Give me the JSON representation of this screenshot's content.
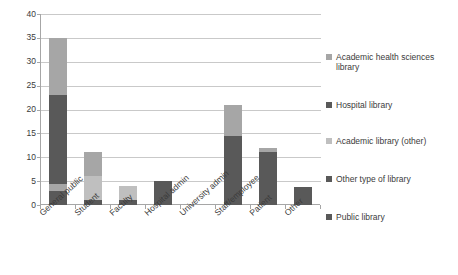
{
  "chart_data": {
    "type": "bar",
    "subtype": "stacked-vertical-bar",
    "title": "",
    "xlabel": "",
    "ylabel": "",
    "ylim": [
      0,
      40
    ],
    "ytick_step": 5,
    "yticks": [
      "0",
      "5",
      "10",
      "15",
      "20",
      "25",
      "30",
      "35",
      "40"
    ],
    "grid": true,
    "legend_position": "right",
    "categories": [
      "General public",
      "Student",
      "Faculty",
      "Hospital admin",
      "University admin",
      "Staff/employee",
      "Patient",
      "Other"
    ],
    "series": [
      {
        "name": "Public library",
        "color": "#595959",
        "values": [
          3,
          1,
          1,
          0,
          0,
          0,
          0,
          0
        ]
      },
      {
        "name": "Other type of library",
        "color": "#a6a6a6",
        "values": [
          1.5,
          0,
          0,
          0,
          0,
          0,
          0,
          0
        ]
      },
      {
        "name": "Academic library (other)",
        "color": "#bfbfbf",
        "values": [
          0,
          5,
          3,
          0,
          0,
          0,
          0,
          0
        ]
      },
      {
        "name": "Hospital library",
        "color": "#595959",
        "values": [
          18.5,
          0,
          0,
          5,
          0,
          14.5,
          11,
          3.8
        ]
      },
      {
        "name": "Academic health sciences library",
        "color": "#a6a6a6",
        "values": [
          12,
          5,
          0,
          0,
          0,
          6.5,
          1,
          0
        ]
      }
    ],
    "totals": [
      35,
      11,
      4,
      5,
      0,
      21,
      12,
      3.8
    ]
  },
  "legend": {
    "items": [
      {
        "label": "Academic health sciences library",
        "color": "#a6a6a6"
      },
      {
        "label": "Hospital library",
        "color": "#595959"
      },
      {
        "label": "Academic library (other)",
        "color": "#bfbfbf"
      },
      {
        "label": "Other type of library",
        "color": "#595959"
      },
      {
        "label": "Public library",
        "color": "#595959"
      }
    ]
  },
  "colors": {
    "axis": "#a6a6a6",
    "grid": "#c9c9c9",
    "text": "#3b3b3b",
    "background": "#ffffff",
    "dark_gray": "#595959",
    "mid_gray": "#a6a6a6",
    "light_gray": "#bfbfbf"
  }
}
